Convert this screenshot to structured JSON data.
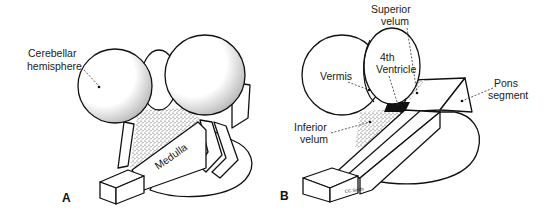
{
  "figure": {
    "panel_a": {
      "letter": "A",
      "labels": {
        "cerebellar_hemisphere": [
          "Cerebellar",
          "hemisphere"
        ],
        "medulla": "Medulla"
      }
    },
    "panel_b": {
      "letter": "B",
      "labels": {
        "superior_velum": [
          "Superior",
          "velum"
        ],
        "fourth_ventricle": [
          "4th",
          "Ventricle"
        ],
        "vermis": "Vermis",
        "pons_segment": [
          "Pons",
          "segment"
        ],
        "inferior_velum": [
          "Inferior",
          "velum"
        ]
      },
      "signature": "CC Smith"
    }
  }
}
